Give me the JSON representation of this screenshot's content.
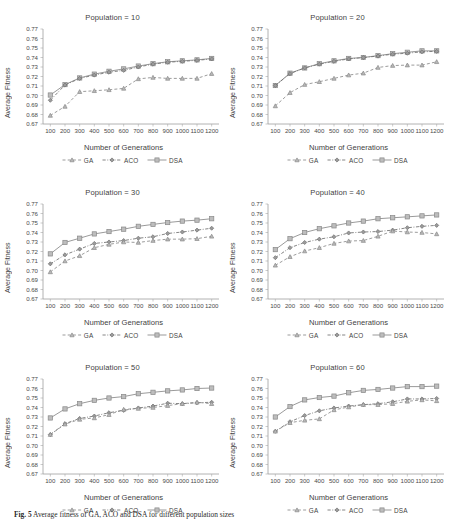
{
  "figure": {
    "caption_label": "Fig. 5",
    "caption_text": "Average fitness of  GA, ACO and DSA for different population sizes",
    "xlabel": "Number of Generations",
    "ylabel": "Average Fitness",
    "legend": [
      {
        "name": "GA",
        "marker": "triangle-marker",
        "dash": "dashed",
        "color": "#7a7a7a"
      },
      {
        "name": "ACO",
        "marker": "diamond-marker",
        "dash": "dashdot",
        "color": "#6e6e6e"
      },
      {
        "name": "DSA",
        "marker": "square-marker",
        "dash": "solid",
        "color": "#8c8c8c"
      }
    ],
    "axis_color": "#9a9a9a",
    "text_color": "#3f3f3f"
  },
  "chart_data": [
    {
      "type": "line",
      "title": "Population = 10",
      "xlabel": "Number of Generations",
      "ylabel": "Average Fitness",
      "categories": [
        100,
        200,
        300,
        400,
        500,
        600,
        700,
        800,
        900,
        1000,
        1100,
        1200
      ],
      "ylim": [
        0.67,
        0.77
      ],
      "yticks": [
        "0.67",
        "0.68",
        "0.69",
        "0.70",
        "0.71",
        "0.72",
        "0.73",
        "0.74",
        "0.75",
        "0.76",
        "0.77"
      ],
      "grid": false,
      "legend_position": "bottom",
      "series": [
        {
          "name": "GA",
          "values": [
            0.679,
            0.6885,
            0.704,
            0.705,
            0.706,
            0.7075,
            0.7175,
            0.719,
            0.718,
            0.718,
            0.718,
            0.723
          ]
        },
        {
          "name": "ACO",
          "values": [
            0.695,
            0.711,
            0.718,
            0.7215,
            0.7245,
            0.7265,
            0.73,
            0.733,
            0.735,
            0.736,
            0.737,
            0.7385
          ]
        },
        {
          "name": "DSA",
          "values": [
            0.7005,
            0.7115,
            0.7185,
            0.7225,
            0.7255,
            0.728,
            0.731,
            0.7335,
            0.7355,
            0.7365,
            0.7375,
            0.739
          ]
        }
      ]
    },
    {
      "type": "line",
      "title": "Population = 20",
      "xlabel": "Number of Generations",
      "ylabel": "Average Fitness",
      "categories": [
        100,
        200,
        300,
        400,
        500,
        600,
        700,
        800,
        900,
        1000,
        1100,
        1200
      ],
      "ylim": [
        0.67,
        0.77
      ],
      "yticks": [
        "0.67",
        "0.68",
        "0.69",
        "0.70",
        "0.71",
        "0.72",
        "0.73",
        "0.74",
        "0.75",
        "0.76",
        "0.77"
      ],
      "grid": false,
      "legend_position": "bottom",
      "series": [
        {
          "name": "GA",
          "values": [
            0.689,
            0.703,
            0.7115,
            0.7145,
            0.718,
            0.7215,
            0.7235,
            0.7295,
            0.7315,
            0.732,
            0.732,
            0.7355
          ]
        },
        {
          "name": "ACO",
          "values": [
            0.7105,
            0.723,
            0.729,
            0.733,
            0.736,
            0.7385,
            0.74,
            0.7415,
            0.7435,
            0.7445,
            0.746,
            0.7465
          ]
        },
        {
          "name": "DSA",
          "values": [
            0.7105,
            0.7235,
            0.729,
            0.7335,
            0.7365,
            0.739,
            0.74,
            0.742,
            0.744,
            0.7455,
            0.747,
            0.747
          ]
        }
      ]
    },
    {
      "type": "line",
      "title": "Population = 30",
      "xlabel": "Number of Generations",
      "ylabel": "Average Fitness",
      "categories": [
        100,
        200,
        300,
        400,
        500,
        600,
        700,
        800,
        900,
        1000,
        1100,
        1200
      ],
      "ylim": [
        0.67,
        0.77
      ],
      "yticks": [
        "0.67",
        "0.68",
        "0.69",
        "0.70",
        "0.71",
        "0.72",
        "0.73",
        "0.74",
        "0.75",
        "0.76",
        "0.77"
      ],
      "grid": false,
      "legend_position": "bottom",
      "series": [
        {
          "name": "GA",
          "values": [
            0.6985,
            0.71,
            0.7155,
            0.724,
            0.7275,
            0.73,
            0.7295,
            0.7315,
            0.733,
            0.733,
            0.7335,
            0.736
          ]
        },
        {
          "name": "ACO",
          "values": [
            0.707,
            0.7165,
            0.7225,
            0.7285,
            0.73,
            0.7315,
            0.734,
            0.7355,
            0.739,
            0.7405,
            0.7425,
            0.7445
          ]
        },
        {
          "name": "DSA",
          "values": [
            0.7175,
            0.7295,
            0.734,
            0.7385,
            0.741,
            0.7435,
            0.7465,
            0.7485,
            0.7505,
            0.752,
            0.753,
            0.7545
          ]
        }
      ]
    },
    {
      "type": "line",
      "title": "Population = 40",
      "xlabel": "Number of Generations",
      "ylabel": "Average Fitness",
      "categories": [
        100,
        200,
        300,
        400,
        500,
        600,
        700,
        800,
        900,
        1000,
        1100,
        1200
      ],
      "ylim": [
        0.67,
        0.77
      ],
      "yticks": [
        "0.67",
        "0.68",
        "0.69",
        "0.70",
        "0.71",
        "0.72",
        "0.73",
        "0.74",
        "0.75",
        "0.76",
        "0.77"
      ],
      "grid": false,
      "legend_position": "bottom",
      "series": [
        {
          "name": "GA",
          "values": [
            0.7055,
            0.7145,
            0.7205,
            0.724,
            0.7285,
            0.731,
            0.7315,
            0.736,
            0.7415,
            0.7405,
            0.74,
            0.7385
          ]
        },
        {
          "name": "ACO",
          "values": [
            0.7135,
            0.724,
            0.7295,
            0.733,
            0.7355,
            0.7395,
            0.7405,
            0.741,
            0.7425,
            0.745,
            0.7465,
            0.7475
          ]
        },
        {
          "name": "DSA",
          "values": [
            0.722,
            0.7335,
            0.74,
            0.744,
            0.747,
            0.75,
            0.752,
            0.7545,
            0.7555,
            0.7565,
            0.7575,
            0.7585
          ]
        }
      ]
    },
    {
      "type": "line",
      "title": "Population = 50",
      "xlabel": "Number of Generations",
      "ylabel": "Average Fitness",
      "categories": [
        100,
        200,
        300,
        400,
        500,
        600,
        700,
        800,
        900,
        1000,
        1100,
        1200
      ],
      "ylim": [
        0.67,
        0.77
      ],
      "yticks": [
        "0.67",
        "0.68",
        "0.69",
        "0.70",
        "0.71",
        "0.72",
        "0.73",
        "0.74",
        "0.75",
        "0.76",
        "0.77"
      ],
      "grid": false,
      "legend_position": "bottom",
      "series": [
        {
          "name": "GA",
          "values": [
            0.7115,
            0.7225,
            0.7275,
            0.729,
            0.7325,
            0.738,
            0.739,
            0.74,
            0.742,
            0.744,
            0.7455,
            0.744
          ]
        },
        {
          "name": "ACO",
          "values": [
            0.7115,
            0.723,
            0.7285,
            0.731,
            0.7345,
            0.737,
            0.7395,
            0.7415,
            0.7445,
            0.744,
            0.745,
            0.7455
          ]
        },
        {
          "name": "DSA",
          "values": [
            0.729,
            0.7385,
            0.744,
            0.7475,
            0.75,
            0.7515,
            0.7545,
            0.756,
            0.7575,
            0.7585,
            0.76,
            0.7605
          ]
        }
      ]
    },
    {
      "type": "line",
      "title": "Population = 60",
      "xlabel": "Number of Generations",
      "ylabel": "Average Fitness",
      "categories": [
        100,
        200,
        300,
        400,
        500,
        600,
        700,
        800,
        900,
        1000,
        1100,
        1200
      ],
      "ylim": [
        0.67,
        0.77
      ],
      "yticks": [
        "0.67",
        "0.68",
        "0.69",
        "0.70",
        "0.71",
        "0.72",
        "0.73",
        "0.74",
        "0.75",
        "0.76",
        "0.77"
      ],
      "grid": false,
      "legend_position": "bottom",
      "series": [
        {
          "name": "GA",
          "values": [
            0.715,
            0.724,
            0.7265,
            0.728,
            0.7375,
            0.7405,
            0.743,
            0.743,
            0.744,
            0.7465,
            0.748,
            0.747
          ]
        },
        {
          "name": "ACO",
          "values": [
            0.715,
            0.725,
            0.7315,
            0.7365,
            0.7395,
            0.7415,
            0.743,
            0.744,
            0.746,
            0.749,
            0.749,
            0.7495
          ]
        },
        {
          "name": "DSA",
          "values": [
            0.73,
            0.741,
            0.748,
            0.7505,
            0.752,
            0.7555,
            0.758,
            0.759,
            0.7605,
            0.762,
            0.762,
            0.7625
          ]
        }
      ]
    }
  ]
}
